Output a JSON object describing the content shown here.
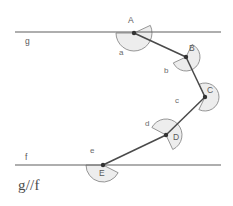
{
  "figure": {
    "caption": "g//f",
    "stroke_color": "#5f5f5f",
    "arc_fill_color": "#ededed",
    "arc_stroke_color": "#8a8a8a",
    "vertex_color": "#333333",
    "background_color": "#ffffff"
  },
  "lines": [
    {
      "id": "g",
      "label": "g",
      "label_x": 25,
      "label_y": 36,
      "x1": 15,
      "y1": 32,
      "x2": 221,
      "y2": 32
    },
    {
      "id": "f",
      "label": "f",
      "label_x": 25,
      "label_y": 152,
      "x1": 15,
      "y1": 165,
      "x2": 221,
      "y2": 165
    }
  ],
  "vertices": [
    {
      "id": "A",
      "label": "A",
      "x": 134,
      "y": 33,
      "label_x": 128,
      "label_y": 15
    },
    {
      "id": "B",
      "label": "B",
      "x": 186,
      "y": 57,
      "label_x": 189,
      "label_y": 43
    },
    {
      "id": "C",
      "label": "C",
      "x": 205,
      "y": 97,
      "label_x": 207,
      "label_y": 85
    },
    {
      "id": "D",
      "label": "D",
      "x": 166,
      "y": 135,
      "label_x": 173,
      "label_y": 132
    },
    {
      "id": "E",
      "label": "E",
      "x": 103,
      "y": 165,
      "label_x": 99,
      "label_y": 168
    }
  ],
  "segments": [
    {
      "id": "AB",
      "from": "A",
      "to": "B"
    },
    {
      "id": "BC",
      "from": "B",
      "to": "C"
    },
    {
      "id": "CD",
      "from": "C",
      "to": "D"
    },
    {
      "id": "DE",
      "from": "D",
      "to": "E"
    }
  ],
  "angles": [
    {
      "id": "a",
      "label": "a",
      "vertex": "A",
      "radius": 18,
      "start_deg": 180,
      "end_deg": 25,
      "label_x": 119,
      "label_y": 48
    },
    {
      "id": "b",
      "label": "b",
      "vertex": "B",
      "radius": 14,
      "start_deg": 205,
      "end_deg": 64,
      "label_x": 164,
      "label_y": 66
    },
    {
      "id": "c",
      "label": "c",
      "vertex": "C",
      "radius": 14,
      "start_deg": 244,
      "end_deg": 115,
      "label_x": 175,
      "label_y": 96
    },
    {
      "id": "d",
      "label": "d",
      "vertex": "D",
      "radius": 16,
      "start_deg": 295,
      "end_deg": 152,
      "label_x": 145,
      "label_y": 119
    },
    {
      "id": "e",
      "label": "e",
      "vertex": "E",
      "radius": 17,
      "start_deg": 180,
      "end_deg": 333,
      "label_x": 90,
      "label_y": 146
    }
  ],
  "caption": {
    "text": "g//f",
    "x": 18,
    "y": 177
  }
}
